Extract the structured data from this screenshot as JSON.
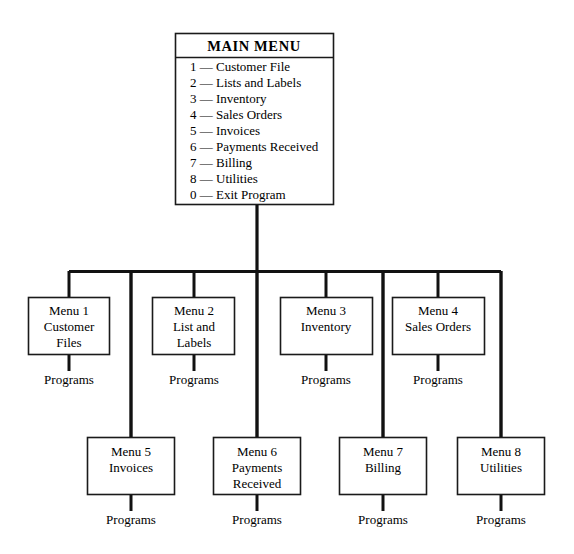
{
  "diagram": {
    "type": "hierarchy-tree",
    "colors": {
      "background": "#ffffff",
      "line": "#111111",
      "box_border": "#1a1a1a",
      "text": "#000000"
    },
    "main_menu": {
      "title": "MAIN MENU",
      "items": [
        "1 — Customer File",
        "2 — Lists and Labels",
        "3 — Inventory",
        "4 — Sales Orders",
        "5 — Invoices",
        "6 — Payments Received",
        "7 — Billing",
        "8 — Utilities",
        "0 — Exit Program"
      ]
    },
    "submenus": [
      {
        "id": "menu-1",
        "row": 1,
        "lines": [
          "Menu 1",
          "Customer",
          "Files"
        ],
        "programs_label": "Programs"
      },
      {
        "id": "menu-2",
        "row": 1,
        "lines": [
          "Menu 2",
          "List and",
          "Labels"
        ],
        "programs_label": "Programs"
      },
      {
        "id": "menu-3",
        "row": 1,
        "lines": [
          "Menu 3",
          "Inventory"
        ],
        "programs_label": "Programs"
      },
      {
        "id": "menu-4",
        "row": 1,
        "lines": [
          "Menu 4",
          "Sales Orders"
        ],
        "programs_label": "Programs"
      },
      {
        "id": "menu-5",
        "row": 2,
        "lines": [
          "Menu 5",
          "Invoices"
        ],
        "programs_label": "Programs"
      },
      {
        "id": "menu-6",
        "row": 2,
        "lines": [
          "Menu 6",
          "Payments",
          "Received"
        ],
        "programs_label": "Programs"
      },
      {
        "id": "menu-7",
        "row": 2,
        "lines": [
          "Menu 7",
          "Billing"
        ],
        "programs_label": "Programs"
      },
      {
        "id": "menu-8",
        "row": 2,
        "lines": [
          "Menu 8",
          "Utilities"
        ],
        "programs_label": "Programs"
      }
    ]
  }
}
